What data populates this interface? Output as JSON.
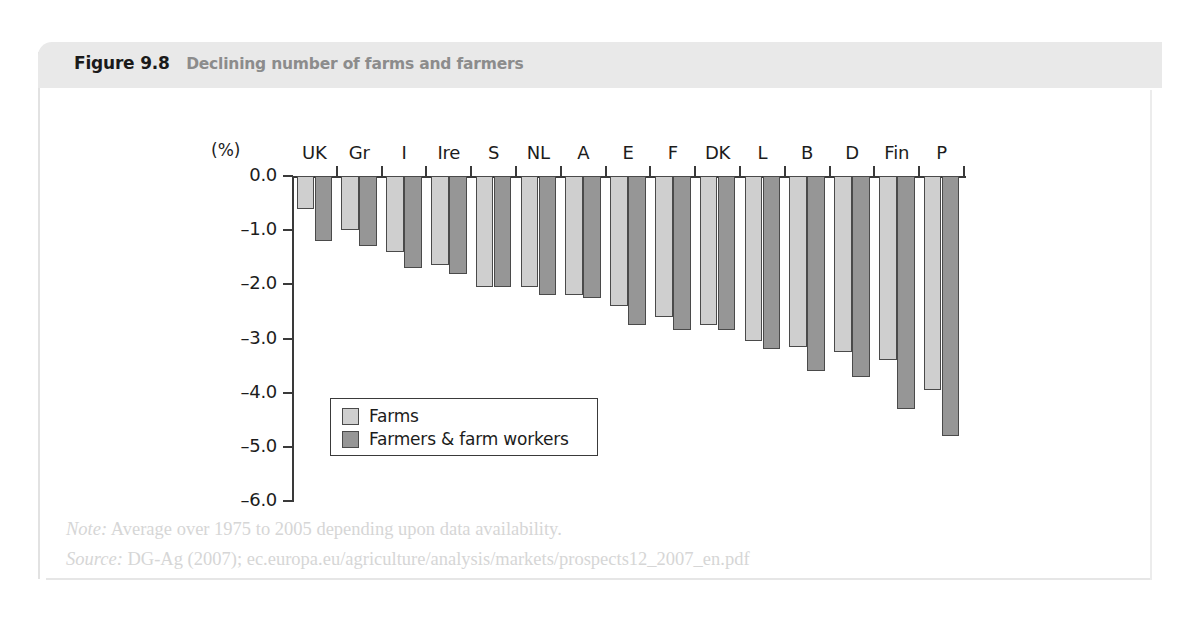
{
  "figure": {
    "label": "Figure 9.8",
    "title": "Declining number of farms and farmers",
    "note_prefix": "Note:",
    "note_text": "Average over 1975 to 2005 depending upon data availability.",
    "source_prefix": "Source:",
    "source_text": "DG-Ag (2007); ec.europa.eu/agriculture/analysis/markets/prospects12_2007_en.pdf"
  },
  "colors": {
    "header_band": "#e9e9e9",
    "series_farms": "#cfcfcf",
    "series_farmers": "#969696",
    "axis": "#3a3a3a",
    "title_text": "#8c8c8c",
    "footnote_text": "#d6d6d6"
  },
  "chart_data": {
    "type": "bar",
    "title": "Declining number of farms and farmers",
    "xlabel": "",
    "ylabel": "(%)",
    "unit_label": "(%)",
    "ylim": [
      -6.0,
      0.0
    ],
    "yticks": [
      0.0,
      -1.0,
      -2.0,
      -3.0,
      -4.0,
      -5.0,
      -6.0
    ],
    "ytick_labels": [
      "0.0",
      "–1.0",
      "–2.0",
      "–3.0",
      "–4.0",
      "–5.0",
      "–6.0"
    ],
    "grid": false,
    "legend_position": "inside-lower-left",
    "categories": [
      "UK",
      "Gr",
      "I",
      "Ire",
      "S",
      "NL",
      "A",
      "E",
      "F",
      "DK",
      "L",
      "B",
      "D",
      "Fin",
      "P"
    ],
    "series": [
      {
        "name": "Farms",
        "color": "#cfcfcf",
        "values": [
          -0.6,
          -1.0,
          -1.4,
          -1.65,
          -2.05,
          -2.05,
          -2.2,
          -2.4,
          -2.6,
          -2.75,
          -3.05,
          -3.15,
          -3.25,
          -3.4,
          -3.95
        ]
      },
      {
        "name": "Farmers & farm workers",
        "color": "#969696",
        "values": [
          -1.2,
          -1.3,
          -1.7,
          -1.8,
          -2.05,
          -2.2,
          -2.25,
          -2.75,
          -2.85,
          -2.85,
          -3.2,
          -3.6,
          -3.7,
          -4.3,
          -4.8
        ]
      }
    ]
  }
}
